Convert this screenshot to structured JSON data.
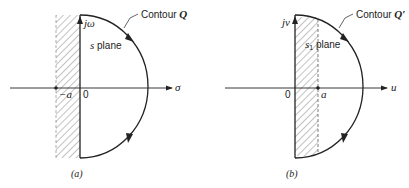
{
  "panels": [
    {
      "id": "a",
      "caption": "(a)",
      "contour_label": "Contour ",
      "contour_symbol": "Q",
      "plane_label_var": "s",
      "plane_label_sub": "",
      "plane_label_word": " plane",
      "vertical_axis_label": "jω",
      "horizontal_axis_label": "σ",
      "origin_label": "0",
      "point_label": "−a"
    },
    {
      "id": "b",
      "caption": "(b)",
      "contour_label": "Contour ",
      "contour_symbol": "Q′",
      "plane_label_var": "s",
      "plane_label_sub": "1",
      "plane_label_word": " plane",
      "vertical_axis_label": "jv",
      "horizontal_axis_label": "u",
      "origin_label": "0",
      "point_label": "a"
    }
  ],
  "colors": {
    "ink": "#222222",
    "hatch": "#555555",
    "background": "#ffffff"
  }
}
